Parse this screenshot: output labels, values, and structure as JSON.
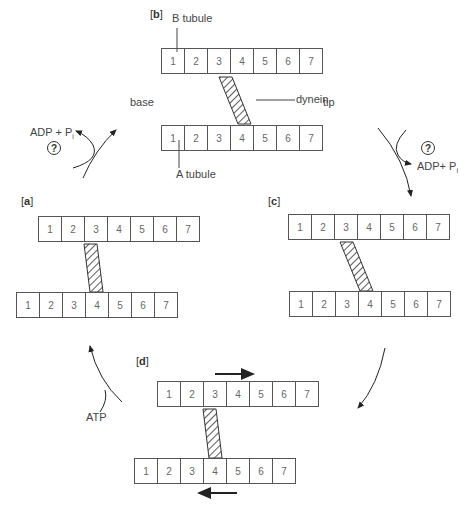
{
  "cells": [
    "1",
    "2",
    "3",
    "4",
    "5",
    "6",
    "7"
  ],
  "panels": {
    "a": {
      "label_open": "[",
      "letter": "a",
      "label_close": "]"
    },
    "b": {
      "label_open": "[",
      "letter": "b",
      "label_close": "]"
    },
    "c": {
      "label_open": "[",
      "letter": "c",
      "label_close": "]"
    },
    "d": {
      "label_open": "[",
      "letter": "d",
      "label_close": "]"
    }
  },
  "labels": {
    "b_tubule": "B tubule",
    "a_tubule": "A tubule",
    "dynein": "dynein",
    "base": "base",
    "tip": "tip",
    "adp_left": "ADP + P",
    "adp_right": "ADP+ P",
    "pi_sub": "i",
    "atp": "ATP",
    "question": "?"
  }
}
